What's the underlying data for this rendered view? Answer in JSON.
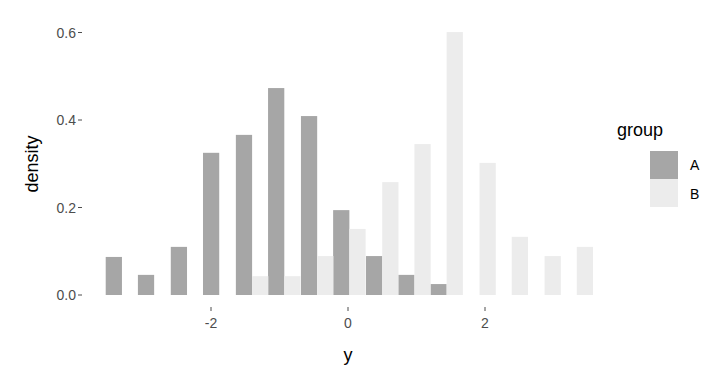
{
  "chart_data": {
    "type": "bar",
    "subtype": "dodged-histogram",
    "title": "",
    "xlabel": "y",
    "ylabel": "density",
    "xlim": [
      -3.55,
      3.6
    ],
    "ylim": [
      0,
      0.62
    ],
    "x_ticks": [
      -2,
      0,
      2
    ],
    "x_tick_labels": [
      "-2",
      "0",
      "2"
    ],
    "y_ticks": [
      0.0,
      0.2,
      0.4,
      0.6
    ],
    "y_tick_labels": [
      "0.0",
      "0.2",
      "0.4",
      "0.6"
    ],
    "grid": false,
    "legend_position": "right",
    "bin_width": 0.474,
    "bin_centers": [
      -3.3,
      -2.83,
      -2.35,
      -1.88,
      -1.4,
      -0.93,
      -0.45,
      0.02,
      0.5,
      0.97,
      1.44,
      1.92,
      2.39,
      2.87,
      3.34
    ],
    "series": [
      {
        "name": "A",
        "color": "#a6a6a6",
        "values": [
          0.087,
          0.046,
          0.11,
          0.325,
          0.366,
          0.473,
          0.409,
          0.194,
          0.089,
          0.046,
          0.025,
          0,
          0,
          0,
          0
        ]
      },
      {
        "name": "B",
        "color": "#ececec",
        "values": [
          0,
          0,
          0,
          0,
          0.043,
          0.043,
          0.089,
          0.151,
          0.258,
          0.345,
          0.601,
          0.302,
          0.133,
          0.089,
          0.11
        ]
      }
    ]
  },
  "legend": {
    "title": "group",
    "items": [
      {
        "label": "A",
        "color": "#a6a6a6"
      },
      {
        "label": "B",
        "color": "#ececec"
      }
    ]
  },
  "axes": {
    "x_title": "y",
    "y_title": "density"
  }
}
